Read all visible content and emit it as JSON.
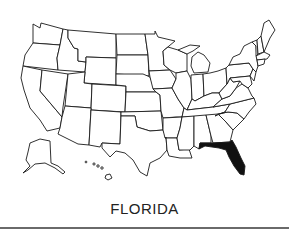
{
  "map": {
    "title": "FLORIDA",
    "region": "United States",
    "highlighted_state": "Florida",
    "highlight_color": "#111111",
    "state_fill": "#ffffff",
    "border_color": "#1a1a1a",
    "insets": [
      "Alaska",
      "Hawaii"
    ]
  }
}
